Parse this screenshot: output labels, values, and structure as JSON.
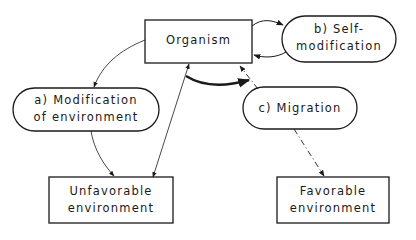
{
  "diagram": {
    "nodes": {
      "organism": {
        "label": "Organism",
        "shape": "rectangle"
      },
      "self_modification": {
        "line1": "b)  Self-",
        "line2": "modification",
        "shape": "ellipse"
      },
      "modification_env": {
        "line1": "a) Modification",
        "line2": "of environment",
        "shape": "ellipse"
      },
      "migration": {
        "label": "c)  Migration",
        "shape": "ellipse"
      },
      "unfavorable": {
        "line1": "Unfavorable",
        "line2": "environment",
        "shape": "rectangle"
      },
      "favorable": {
        "line1": "Favorable",
        "line2": "environment",
        "shape": "rectangle"
      }
    },
    "edges": [
      {
        "from": "organism",
        "to": "self_modification",
        "style": "solid"
      },
      {
        "from": "self_modification",
        "to": "organism",
        "style": "solid"
      },
      {
        "from": "organism",
        "to": "modification_env",
        "style": "solid-thin"
      },
      {
        "from": "modification_env",
        "to": "unfavorable",
        "style": "solid"
      },
      {
        "from": "organism",
        "to": "unfavorable",
        "style": "solid-bidirectional"
      },
      {
        "from": "migration",
        "to": "organism",
        "style": "dash-dot"
      },
      {
        "from": "migration",
        "to": "favorable",
        "style": "dash-dot"
      },
      {
        "from": "unfavorable-side",
        "to": "migration-side",
        "style": "bold-curved"
      }
    ],
    "colors": {
      "stroke": "#1a1a1a",
      "background": "#ffffff"
    }
  }
}
